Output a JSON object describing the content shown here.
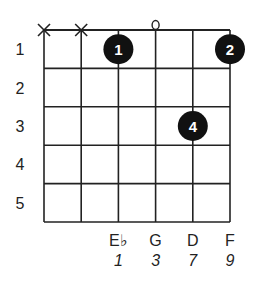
{
  "chord_diagram": {
    "strings": 6,
    "frets": 5,
    "fret_labels": [
      "1",
      "2",
      "3",
      "4",
      "5"
    ],
    "string_markers": [
      {
        "string": 1,
        "symbol": "X",
        "meaning": "muted"
      },
      {
        "string": 2,
        "symbol": "X",
        "meaning": "muted"
      },
      {
        "string": 4,
        "symbol": "o",
        "meaning": "open"
      }
    ],
    "fingers": [
      {
        "string": 3,
        "fret": 1,
        "label": "1"
      },
      {
        "string": 6,
        "fret": 1,
        "label": "2"
      },
      {
        "string": 5,
        "fret": 3,
        "label": "4"
      }
    ],
    "bottom_notes": [
      {
        "string": 3,
        "note": "E♭",
        "interval": "1"
      },
      {
        "string": 4,
        "note": "G",
        "interval": "3"
      },
      {
        "string": 5,
        "note": "D",
        "interval": "7"
      },
      {
        "string": 6,
        "note": "F",
        "interval": "9"
      }
    ],
    "colors": {
      "line": "#222222",
      "dot": "#111111",
      "dot_text": "#ffffff"
    }
  }
}
